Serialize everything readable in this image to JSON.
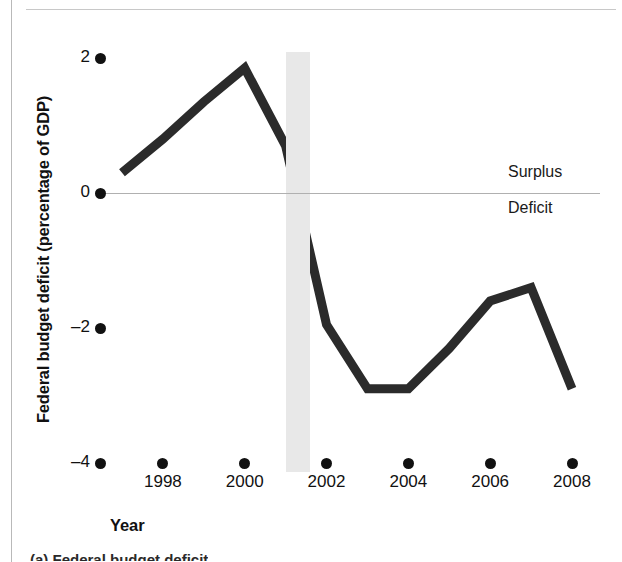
{
  "figure": {
    "y_axis_title": "Federal budget deficit (percentage of GDP)",
    "x_axis_title": "Year",
    "surplus_label": "Surplus",
    "deficit_label": "Deficit",
    "caption_clipped": "(a) Federal budget deficit"
  },
  "colors": {
    "line": "#2b2b2b",
    "recession_band": "#e8e8e8",
    "zero_line": "#b0b0b0",
    "text": "#111111",
    "page_rule": "#c8c8c8",
    "left_rule": "#b9b9b9",
    "background": "#ffffff"
  },
  "chart_data": {
    "type": "line",
    "title": "",
    "xlabel": "Year",
    "ylabel": "Federal budget deficit (percentage of GDP)",
    "xlim": [
      1997,
      2008
    ],
    "ylim": [
      -4,
      2
    ],
    "grid": false,
    "legend": "none",
    "y_ticks": [
      2,
      0,
      -2,
      -4
    ],
    "y_tick_labels": [
      "2",
      "0",
      "-2",
      "-4"
    ],
    "x_ticks": [
      1998,
      2000,
      2002,
      2004,
      2006,
      2008
    ],
    "x_tick_labels": [
      "1998",
      "2000",
      "2002",
      "2004",
      "2006",
      "2008"
    ],
    "series": [
      {
        "name": "Federal budget surplus/deficit",
        "x": [
          1997,
          1998,
          1999,
          2000,
          2001,
          2002,
          2003,
          2004,
          2005,
          2006,
          2007,
          2008
        ],
        "values": [
          0.3,
          0.8,
          1.35,
          1.85,
          0.7,
          -1.95,
          -2.9,
          -2.9,
          -2.3,
          -1.6,
          -1.4,
          -2.9
        ]
      }
    ],
    "annotations": [
      {
        "name": "zero-reference-line",
        "type": "hline",
        "y": 0
      },
      {
        "name": "surplus-label",
        "type": "text",
        "text": "Surplus",
        "y": 0.25
      },
      {
        "name": "deficit-label",
        "type": "text",
        "text": "Deficit",
        "y": -0.3
      },
      {
        "name": "recession-band-2001",
        "type": "vspan",
        "x_start": 2001.0,
        "x_end": 2001.6
      }
    ]
  }
}
